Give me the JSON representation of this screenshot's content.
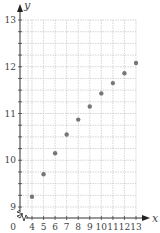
{
  "chart_data": {
    "type": "scatter",
    "title": "",
    "xlabel": "x",
    "ylabel": "y",
    "xlim": [
      4,
      13
    ],
    "ylim": [
      9,
      13
    ],
    "x_ticks": [
      "4",
      "5",
      "6",
      "7",
      "8",
      "9",
      "10",
      "11",
      "12",
      "13"
    ],
    "y_ticks": [
      "9",
      "10",
      "11",
      "12",
      "13"
    ],
    "origin_label": "0",
    "grid": true,
    "axis_break": true,
    "legend": null,
    "series": [
      {
        "name": "points",
        "color": "#777777",
        "x": [
          4,
          5,
          6,
          7,
          8,
          9,
          10,
          11,
          12,
          13
        ],
        "y": [
          9.22,
          9.7,
          10.15,
          10.55,
          10.87,
          11.15,
          11.43,
          11.65,
          11.86,
          12.08
        ]
      }
    ]
  }
}
